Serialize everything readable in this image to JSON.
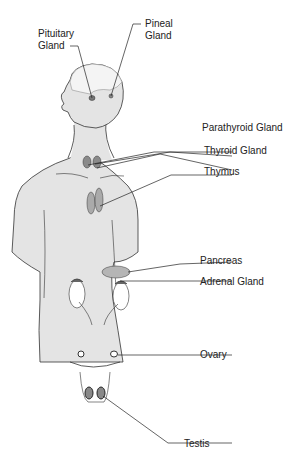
{
  "colors": {
    "body_fill": "#e4e4e4",
    "outline": "#333333",
    "leader": "#222222",
    "gland": "#9a9a9a",
    "organ_white": "#ffffff"
  },
  "labels": [
    {
      "id": "pituitary",
      "line1": "Pituitary",
      "line2": "Gland"
    },
    {
      "id": "pineal",
      "line1": "Pineal",
      "line2": "Gland"
    },
    {
      "id": "parathyroid",
      "line1": "Parathyroid Gland"
    },
    {
      "id": "thyroid",
      "line1": "Thyroid Gland"
    },
    {
      "id": "thymus",
      "line1": "Thymus"
    },
    {
      "id": "pancreas",
      "line1": "Pancreas"
    },
    {
      "id": "adrenal",
      "line1": "Adrenal Gland"
    },
    {
      "id": "ovary",
      "line1": "Ovary"
    },
    {
      "id": "testis",
      "line1": "Testis"
    }
  ]
}
